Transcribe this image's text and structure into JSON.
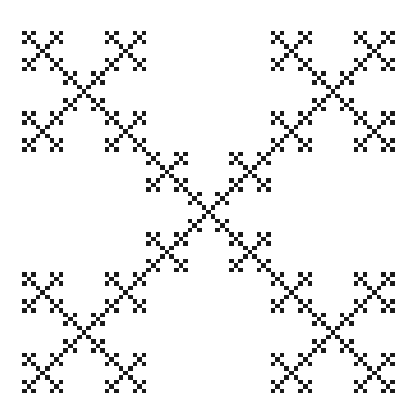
{
  "figure": {
    "type": "vicsek-x-fractal",
    "levels": 4,
    "foreground_color": "#1a1a1a",
    "background_color": "#ffffff"
  }
}
